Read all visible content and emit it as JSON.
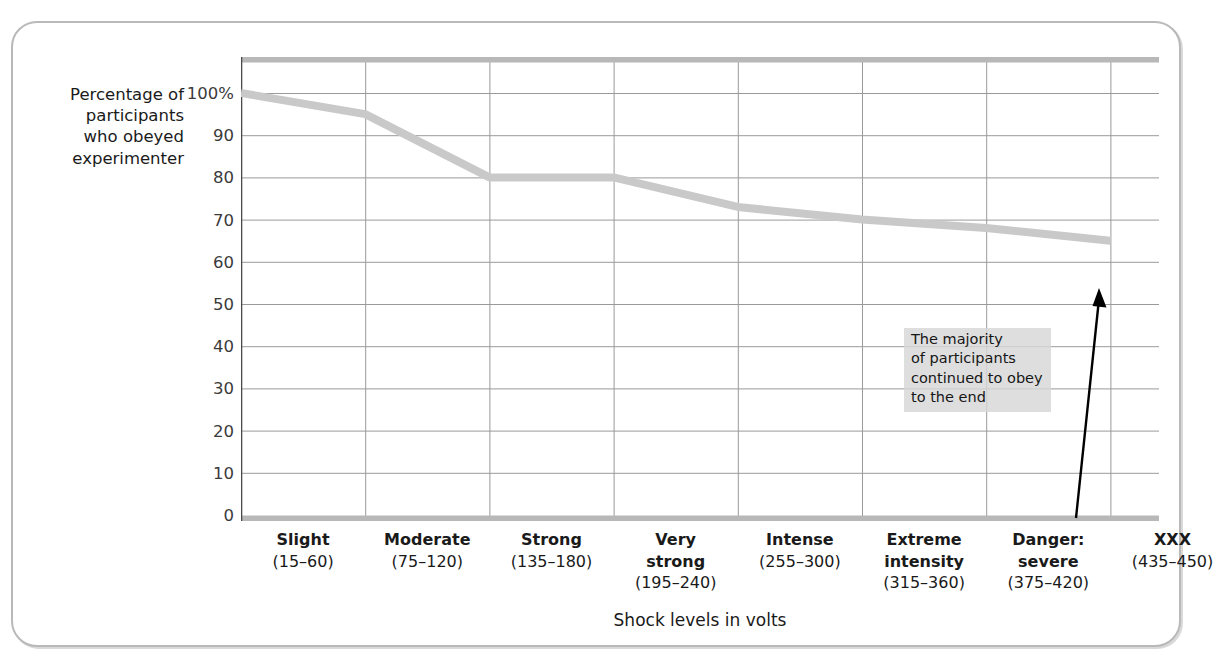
{
  "chart_data": {
    "type": "line",
    "title": "",
    "ylabel": "Percentage of\nparticipants\nwho obeyed\nexperimenter",
    "xlabel": "Shock levels in volts",
    "ylim": [
      0,
      100
    ],
    "ytick_labels": [
      "100%",
      "90",
      "80",
      "70",
      "60",
      "50",
      "40",
      "30",
      "20",
      "10",
      "0"
    ],
    "ytick_values": [
      100,
      90,
      80,
      70,
      60,
      50,
      40,
      30,
      20,
      10,
      0
    ],
    "grid": true,
    "legend": "none",
    "categories": [
      {
        "name": "Slight",
        "range": "(15–60)"
      },
      {
        "name": "Moderate",
        "range": "(75–120)"
      },
      {
        "name": "Strong",
        "range": "(135–180)"
      },
      {
        "name": "Very\nstrong",
        "range": "(195–240)"
      },
      {
        "name": "Intense",
        "range": "(255–300)"
      },
      {
        "name": "Extreme\nintensity",
        "range": "(315–360)"
      },
      {
        "name": "Danger:\nsevere",
        "range": "(375–420)"
      },
      {
        "name": "XXX",
        "range": "(435–450)"
      }
    ],
    "series": [
      {
        "name": "Percentage of participants who obeyed experimenter",
        "color": "#c9c9c9",
        "values": [
          100,
          95,
          80,
          80,
          73,
          70,
          68,
          65
        ]
      }
    ],
    "annotations": [
      {
        "name": "majority-callout",
        "text": "The majority\nof participants\ncontinued to obey\nto the end",
        "background": "#d7d7d7"
      },
      {
        "name": "callout-arrow",
        "shape": "arrow",
        "color": "#000000"
      }
    ],
    "colors": {
      "line": "#c9c9c9",
      "grid": "#9a9a9a",
      "axis": "#4a4a4a",
      "frame": "#b9b9b9",
      "top_band": "#b8b8b8"
    }
  }
}
